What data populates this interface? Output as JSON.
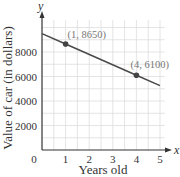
{
  "chart_data": {
    "type": "line",
    "title": "",
    "xlabel": "Years old",
    "ylabel": "Value of car (in dollars)",
    "x_axis_name": "x",
    "y_axis_name": "y",
    "x_ticks": [
      "0",
      "1",
      "2",
      "3",
      "4",
      "5"
    ],
    "y_ticks": [
      "2000",
      "4000",
      "6000",
      "8000"
    ],
    "xlim": [
      0,
      5.3
    ],
    "ylim": [
      0,
      10500
    ],
    "grid": true,
    "series": [
      {
        "name": "Value of car",
        "x": [
          0,
          1,
          4,
          5
        ],
        "y": [
          9500,
          8650,
          6100,
          5250
        ],
        "color": "#4a4a4a"
      }
    ],
    "points": [
      {
        "x": 1,
        "y": 8650,
        "label": "(1, 8650)"
      },
      {
        "x": 4,
        "y": 6100,
        "label": "(4, 6100)"
      }
    ],
    "colors": {
      "grid": "#dddddd",
      "axis": "#333333",
      "line": "#4a4a4a",
      "annotation": "#777777"
    }
  }
}
